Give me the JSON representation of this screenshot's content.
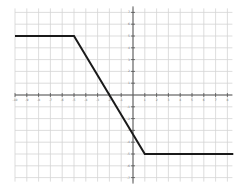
{
  "chart_data": {
    "type": "line",
    "title": "",
    "xlabel": "",
    "ylabel": "",
    "xlim": [
      -10,
      8
    ],
    "ylim": [
      -7,
      7
    ],
    "grid": true,
    "x_ticks": [
      -10,
      -9,
      -8,
      -7,
      -6,
      -5,
      -4,
      -3,
      -2,
      -1,
      1,
      2,
      3,
      4,
      5,
      6,
      7,
      8
    ],
    "y_ticks": [
      -7,
      -6,
      -5,
      -4,
      -3,
      -2,
      -1,
      1,
      2,
      3,
      4,
      5,
      6,
      7
    ],
    "series": [
      {
        "name": "piecewise function",
        "color": "#1a1a1a",
        "x": [
          -10,
          -5,
          1,
          8.5
        ],
        "y": [
          5,
          5,
          -5,
          -5
        ]
      }
    ]
  }
}
